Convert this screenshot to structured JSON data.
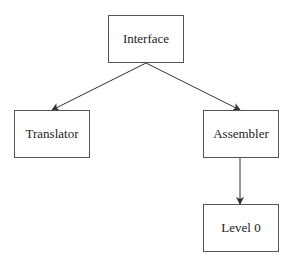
{
  "diagram": {
    "nodes": [
      {
        "id": "interface",
        "label": "Interface"
      },
      {
        "id": "translator",
        "label": "Translator"
      },
      {
        "id": "assembler",
        "label": "Assembler"
      },
      {
        "id": "level0",
        "label": "Level 0"
      }
    ],
    "edges": [
      {
        "from": "interface",
        "to": "translator"
      },
      {
        "from": "interface",
        "to": "assembler"
      },
      {
        "from": "assembler",
        "to": "level0"
      }
    ]
  }
}
